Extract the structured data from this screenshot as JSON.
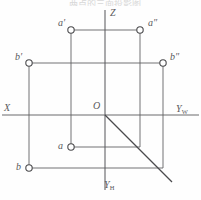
{
  "figure": {
    "caption_top": "两点的三面投影图",
    "axes": {
      "z_label": "Z",
      "x_label": "X",
      "yw_label": "Y",
      "yw_sub": "W",
      "yh_label": "Y",
      "yh_sub": "H",
      "origin_label": "O"
    },
    "points": [
      {
        "id": "a-front",
        "label": "a",
        "prime": "′",
        "x": 71,
        "y": 30
      },
      {
        "id": "a-side",
        "label": "a",
        "prime": "″",
        "x": 140,
        "y": 30
      },
      {
        "id": "b-front",
        "label": "b",
        "prime": "′",
        "x": 29,
        "y": 63
      },
      {
        "id": "b-side",
        "label": "b",
        "prime": "″",
        "x": 163,
        "y": 63
      },
      {
        "id": "a-top",
        "label": "a",
        "prime": "",
        "x": 71,
        "y": 147
      },
      {
        "id": "b-top",
        "label": "b",
        "prime": "",
        "x": 29,
        "y": 168
      }
    ],
    "colors": {
      "line": "#5a5a5d",
      "axis": "#6a6a6d",
      "node_fill": "#ffffff",
      "background": "#fefefe",
      "label": "#59595c"
    },
    "geometry": {
      "origin_x": 105,
      "origin_y": 115,
      "z_top": 10,
      "yh_bottom": 190,
      "x_left": 2,
      "yw_right": 199,
      "diagonal_end_x": 172,
      "diagonal_end_y": 182,
      "node_radius": 3.2
    }
  }
}
